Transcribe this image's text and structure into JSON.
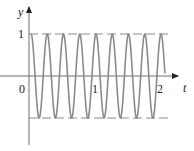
{
  "chart_data": {
    "type": "line",
    "title": "",
    "function": "y = cos(8πt)",
    "xlabel": "t",
    "ylabel": "y",
    "x_ticks": [
      "0",
      "1",
      "2"
    ],
    "y_ticks": [
      "1"
    ],
    "xlim": [
      0,
      2.06
    ],
    "ylim": [
      -1,
      1
    ],
    "reference_lines": [
      {
        "y": 1,
        "style": "dashed"
      },
      {
        "y": -1,
        "style": "dashed"
      }
    ],
    "period": 0.25,
    "peaks_t": [
      0,
      0.25,
      0.5,
      0.75,
      1.0,
      1.25,
      1.5,
      1.75,
      2.0
    ],
    "troughs_t": [
      0.125,
      0.375,
      0.625,
      0.875,
      1.125,
      1.375,
      1.625,
      1.875
    ],
    "grid": false,
    "legend": null,
    "colors": {
      "curve": "#8a8a8a",
      "axes": "#6e6e6e",
      "dashes": "#8a8a8a",
      "text": "#222222"
    }
  },
  "labels": {
    "y_axis": "y",
    "x_axis": "t",
    "origin": "0",
    "tick_one_x": "1",
    "tick_two_x": "2",
    "tick_one_y": "1"
  }
}
